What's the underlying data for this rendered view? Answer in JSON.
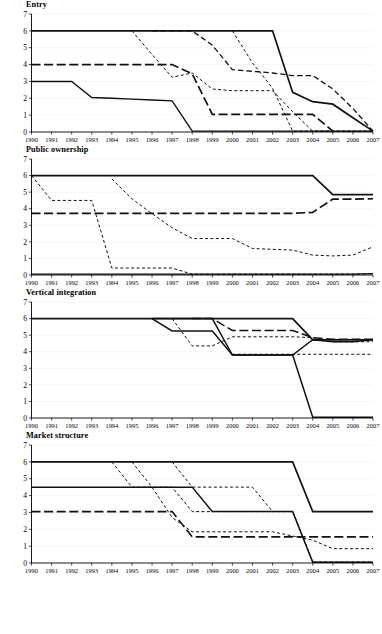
{
  "figure": {
    "title": "",
    "panel_count": 4,
    "x_label": "",
    "y_label": ""
  },
  "panels": [
    {
      "title": "Entry"
    },
    {
      "title": "Public ownership"
    },
    {
      "title": "Vertical integration"
    },
    {
      "title": "Market structure"
    }
  ],
  "chart_data": [
    {
      "type": "line",
      "title": "Entry",
      "xlabel": "",
      "ylabel": "",
      "x": [
        1990,
        1991,
        1992,
        1993,
        1994,
        1995,
        1996,
        1997,
        1998,
        1999,
        2000,
        2001,
        2002,
        2003,
        2004,
        2005,
        2006,
        2007
      ],
      "xlim": [
        1990,
        2007
      ],
      "ylim": [
        0,
        7
      ],
      "yticks": [
        0,
        1,
        2,
        3,
        4,
        5,
        6,
        7
      ],
      "xticks": [
        "1990",
        "1991",
        "1992",
        "1993",
        "1994",
        "1995",
        "1996",
        "1997",
        "1998",
        "1999",
        "2000",
        "2001",
        "2002",
        "2003",
        "2004",
        "2005",
        "2006",
        "2007"
      ],
      "grid": true,
      "legend": "none",
      "series": [
        {
          "name": "series-a",
          "style": "solid",
          "width": 1.7,
          "values": [
            6,
            6,
            6,
            6,
            6,
            6,
            6,
            6,
            6,
            6,
            6,
            6,
            6,
            2.35,
            1.8,
            1.65,
            0.85,
            0.05
          ]
        },
        {
          "name": "series-b",
          "style": "long-dash",
          "width": 1.7,
          "values": [
            4,
            4,
            4,
            4,
            4,
            4,
            4,
            4,
            3.45,
            1.05,
            1.05,
            1.05,
            1.05,
            1.05,
            1.05,
            0.05,
            null,
            null
          ]
        },
        {
          "name": "series-c",
          "style": "solid",
          "width": 1.4,
          "values": [
            3,
            3,
            3,
            2.05,
            2.0,
            1.95,
            1.9,
            1.85,
            0.05,
            0.05,
            0.05,
            0.05,
            0.05,
            0.05,
            0.05,
            0.05,
            0.05,
            0.05
          ]
        },
        {
          "name": "series-d",
          "style": "short-dash",
          "width": 1.0,
          "values": [
            null,
            null,
            null,
            null,
            null,
            6,
            4.6,
            3.25,
            3.5,
            2.55,
            2.45,
            2.45,
            2.45,
            1.2,
            0.05,
            0.05,
            0.05,
            0.05
          ]
        },
        {
          "name": "series-e",
          "style": "dash-med",
          "width": 1.3,
          "values": [
            null,
            null,
            null,
            null,
            null,
            null,
            6,
            6,
            6,
            5.15,
            3.7,
            3.6,
            3.5,
            3.35,
            3.35,
            2.55,
            1.4,
            0.05
          ]
        },
        {
          "name": "series-f",
          "style": "short-dash",
          "width": 1.0,
          "values": [
            null,
            null,
            null,
            null,
            null,
            null,
            null,
            null,
            null,
            null,
            6,
            4.1,
            2.6,
            0.05,
            0.05,
            0.05,
            0.05,
            0.05
          ]
        }
      ]
    },
    {
      "type": "line",
      "title": "Public ownership",
      "xlabel": "",
      "ylabel": "",
      "x": [
        1990,
        1991,
        1992,
        1993,
        1994,
        1995,
        1996,
        1997,
        1998,
        1999,
        2000,
        2001,
        2002,
        2003,
        2004,
        2005,
        2006,
        2007
      ],
      "xlim": [
        1990,
        2007
      ],
      "ylim": [
        0,
        7
      ],
      "yticks": [
        0,
        1,
        2,
        3,
        4,
        5,
        6,
        7
      ],
      "xticks": [
        "1990",
        "1991",
        "1992",
        "1993",
        "1994",
        "1995",
        "1996",
        "1997",
        "1998",
        "1999",
        "2000",
        "2001",
        "2002",
        "2003",
        "2004",
        "2005",
        "2006",
        "2007"
      ],
      "grid": true,
      "legend": "none",
      "series": [
        {
          "name": "series-a",
          "style": "solid",
          "width": 1.7,
          "values": [
            6,
            6,
            6,
            6,
            6,
            6,
            6,
            6,
            6,
            6,
            6,
            6,
            6,
            6,
            6,
            4.85,
            4.85,
            4.85
          ]
        },
        {
          "name": "series-b",
          "style": "long-dash",
          "width": 1.7,
          "values": [
            3.72,
            3.72,
            3.72,
            3.72,
            3.72,
            3.72,
            3.72,
            3.72,
            3.72,
            3.72,
            3.72,
            3.72,
            3.72,
            3.72,
            3.78,
            4.58,
            4.58,
            4.6
          ]
        },
        {
          "name": "series-c",
          "style": "short-dash",
          "width": 1.0,
          "values": [
            6,
            4.5,
            4.5,
            4.5,
            0.42,
            0.42,
            0.42,
            0.42,
            0.05,
            0.05,
            0.05,
            0.05,
            0.05,
            0.05,
            0.05,
            0.05,
            0.05,
            0.08
          ]
        },
        {
          "name": "series-d",
          "style": "short-dash",
          "width": 1.0,
          "values": [
            null,
            null,
            null,
            null,
            5.8,
            4.6,
            3.7,
            2.85,
            2.2,
            2.2,
            2.2,
            1.6,
            1.55,
            1.5,
            1.2,
            1.15,
            1.2,
            1.7
          ]
        },
        {
          "name": "series-e",
          "style": "solid",
          "width": 1.4,
          "values": [
            0.05,
            0.05,
            0.05,
            0.05,
            0.05,
            0.05,
            0.05,
            0.05,
            0.05,
            0.05,
            0.05,
            0.05,
            0.05,
            0.05,
            0.05,
            0.05,
            0.05,
            0.08
          ]
        }
      ]
    },
    {
      "type": "line",
      "title": "Vertical integration",
      "xlabel": "",
      "ylabel": "",
      "x": [
        1990,
        1991,
        1992,
        1993,
        1994,
        1995,
        1996,
        1997,
        1998,
        1999,
        2000,
        2001,
        2002,
        2003,
        2004,
        2005,
        2006,
        2007
      ],
      "xlim": [
        1990,
        2007
      ],
      "ylim": [
        0,
        7
      ],
      "yticks": [
        0,
        1,
        2,
        3,
        4,
        5,
        6,
        7
      ],
      "xticks": [
        "1990",
        "1991",
        "1992",
        "1993",
        "1994",
        "1995",
        "1996",
        "1997",
        "1998",
        "1999",
        "2000",
        "2001",
        "2002",
        "2003",
        "2004",
        "2005",
        "2006",
        "2007"
      ],
      "grid": true,
      "legend": "none",
      "series": [
        {
          "name": "series-a",
          "style": "solid",
          "width": 1.7,
          "values": [
            6,
            6,
            6,
            6,
            6,
            6,
            6,
            6,
            6,
            6,
            6,
            6,
            6,
            6,
            4.72,
            4.72,
            4.72,
            4.72
          ]
        },
        {
          "name": "series-b",
          "style": "solid",
          "width": 1.5,
          "values": [
            null,
            null,
            null,
            null,
            null,
            null,
            6,
            5.25,
            5.25,
            5.25,
            3.8,
            3.8,
            3.8,
            3.8,
            0.05,
            0.05,
            0.05,
            0.05
          ]
        },
        {
          "name": "series-c",
          "style": "solid",
          "width": 1.4,
          "values": [
            null,
            null,
            null,
            null,
            null,
            null,
            6,
            6,
            6,
            6,
            3.8,
            3.8,
            3.8,
            3.8,
            4.72,
            4.6,
            4.6,
            4.72
          ]
        },
        {
          "name": "series-d",
          "style": "long-dash",
          "width": 1.5,
          "values": [
            null,
            null,
            null,
            null,
            null,
            null,
            null,
            null,
            6,
            6,
            5.28,
            5.28,
            5.28,
            5.28,
            4.85,
            4.75,
            4.75,
            4.75
          ]
        },
        {
          "name": "series-e",
          "style": "short-dash",
          "width": 1.0,
          "values": [
            null,
            null,
            null,
            null,
            null,
            null,
            null,
            6,
            4.35,
            4.35,
            4.9,
            4.9,
            4.9,
            4.9,
            4.85,
            4.6,
            4.6,
            4.6
          ]
        },
        {
          "name": "series-f",
          "style": "short-dash",
          "width": 1.1,
          "values": [
            null,
            null,
            null,
            null,
            null,
            null,
            null,
            null,
            null,
            null,
            3.85,
            3.85,
            3.85,
            3.85,
            3.85,
            3.85,
            3.85,
            3.85
          ]
        }
      ]
    },
    {
      "type": "line",
      "title": "Market structure",
      "xlabel": "",
      "ylabel": "",
      "x": [
        1990,
        1991,
        1992,
        1993,
        1994,
        1995,
        1996,
        1997,
        1998,
        1999,
        2000,
        2001,
        2002,
        2003,
        2004,
        2005,
        2006,
        2007
      ],
      "xlim": [
        1990,
        2007
      ],
      "ylim": [
        0,
        7
      ],
      "yticks": [
        0,
        1,
        2,
        3,
        4,
        5,
        6,
        7
      ],
      "xticks": [
        "1990",
        "1991",
        "1992",
        "1993",
        "1994",
        "1995",
        "1996",
        "1997",
        "1998",
        "1999",
        "2000",
        "2001",
        "2002",
        "2003",
        "2004",
        "2005",
        "2006",
        "2007"
      ],
      "grid": true,
      "legend": "none",
      "series": [
        {
          "name": "series-a",
          "style": "solid",
          "width": 1.7,
          "values": [
            6,
            6,
            6,
            6,
            6,
            6,
            6,
            6,
            6,
            6,
            6,
            6,
            6,
            6,
            3.05,
            3.05,
            3.05,
            3.05
          ]
        },
        {
          "name": "series-b",
          "style": "solid",
          "width": 1.5,
          "values": [
            4.5,
            4.5,
            4.5,
            4.5,
            4.5,
            4.5,
            4.5,
            4.5,
            4.5,
            3.05,
            3.05,
            3.05,
            3.05,
            3.05,
            0.05,
            0.05,
            0.05,
            0.05
          ]
        },
        {
          "name": "series-c",
          "style": "long-dash",
          "width": 1.6,
          "values": [
            3.05,
            3.05,
            3.05,
            3.05,
            3.05,
            3.05,
            3.05,
            3.05,
            1.55,
            1.55,
            1.55,
            1.55,
            1.55,
            1.55,
            1.55,
            1.55,
            1.55,
            1.55
          ]
        },
        {
          "name": "series-d",
          "style": "short-dash",
          "width": 1.0,
          "values": [
            null,
            null,
            null,
            null,
            6,
            4.5,
            4.5,
            4.5,
            3.05,
            3.05,
            3.05,
            3.05,
            3.05,
            3.05,
            0.05,
            0.05,
            0.05,
            0.05
          ]
        },
        {
          "name": "series-e",
          "style": "short-dash",
          "width": 1.0,
          "values": [
            null,
            null,
            null,
            null,
            null,
            6,
            4.5,
            2.7,
            1.85,
            1.85,
            1.85,
            1.85,
            1.85,
            1.6,
            1.35,
            0.85,
            0.85,
            0.85
          ]
        },
        {
          "name": "series-f",
          "style": "short-dash",
          "width": 1.0,
          "values": [
            null,
            null,
            null,
            null,
            null,
            null,
            null,
            6,
            4.5,
            4.5,
            4.5,
            4.5,
            3.05,
            3.05,
            0.05,
            0.05,
            0.05,
            0.05
          ]
        }
      ]
    }
  ],
  "axis_style": {
    "grid_color": "#bdbdbd",
    "axis_color": "#000000",
    "line_color": "#111111"
  }
}
